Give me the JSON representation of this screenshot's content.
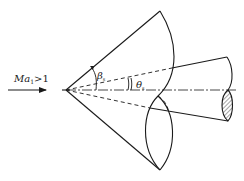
{
  "diagram": {
    "flow_label": {
      "symbol": "Ma",
      "subscript": "1",
      "relation": ">1"
    },
    "angles": {
      "shock_angle": {
        "symbol": "β",
        "subscript": "s"
      },
      "cone_half_angle": {
        "symbol": "θ",
        "subscript": "s"
      }
    },
    "elements": [
      "free-stream arrow",
      "conical shock wave",
      "cone body",
      "axis centerline",
      "hatched cut section"
    ],
    "colors": {
      "stroke": "#1a1a1a",
      "background": "#ffffff"
    }
  }
}
